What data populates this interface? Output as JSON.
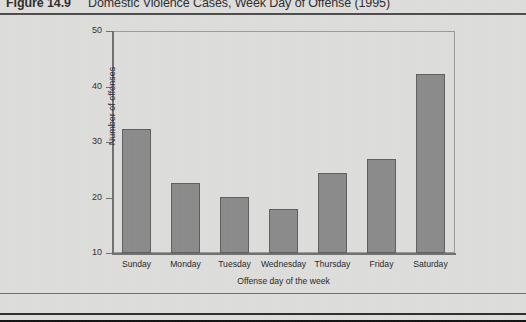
{
  "caption": {
    "number": "Figure 14.9",
    "text": "Domestic Violence Cases, Week Day of Offense (1995)"
  },
  "chart_data": {
    "type": "bar",
    "title": "Domestic Violence Cases, Week Day of Offense (1995)",
    "categories": [
      "Sunday",
      "Monday",
      "Tuesday",
      "Wednesday",
      "Thursday",
      "Friday",
      "Saturday"
    ],
    "values": [
      32.4,
      22.6,
      20.1,
      18.0,
      24.4,
      27.0,
      42.2
    ],
    "xlabel": "Offense day of the week",
    "ylabel": "Number of offenses",
    "ylim": [
      10,
      50
    ],
    "yticks": [
      10,
      20,
      30,
      40,
      50
    ],
    "ytick_labels": [
      "10",
      "20",
      "30",
      "40",
      "50"
    ],
    "grid": false,
    "legend": "none",
    "bar_color": "#8b8b8b",
    "bar_edge_color": "#5e5e5e"
  }
}
